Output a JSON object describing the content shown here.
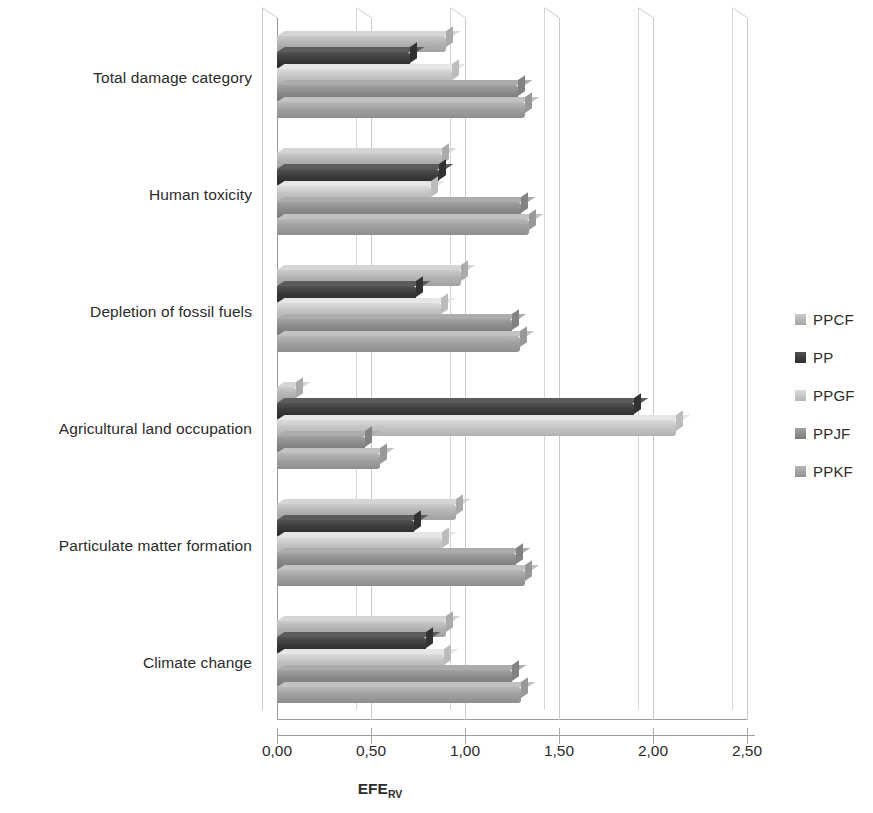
{
  "chart_data": {
    "type": "bar",
    "orientation": "horizontal",
    "title": "",
    "xlabel": "EFE RV",
    "xlabel_base": "EFE",
    "xlabel_subscript": "RV",
    "ylabel": "",
    "xlim": [
      0.0,
      2.5
    ],
    "xticks": [
      0.0,
      0.5,
      1.0,
      1.5,
      2.0,
      2.5
    ],
    "xtick_labels": [
      "0,00",
      "0,50",
      "1,00",
      "1,50",
      "2,00",
      "2,50"
    ],
    "grid": true,
    "grid_axis": "x",
    "legend_position": "right",
    "categories": [
      "Total damage category",
      "Human toxicity",
      "Depletion of fossil fuels",
      "Agricultural land occupation",
      "Particulate matter formation",
      "Climate change"
    ],
    "series": [
      {
        "name": "PPCF",
        "color": "#b3b3b3",
        "values": [
          0.9,
          0.88,
          0.98,
          0.1,
          0.95,
          0.9
        ]
      },
      {
        "name": "PP",
        "color": "#3a3a3a",
        "values": [
          0.71,
          0.86,
          0.74,
          1.9,
          0.73,
          0.79
        ]
      },
      {
        "name": "PPGF",
        "color": "#c4c4c4",
        "values": [
          0.93,
          0.82,
          0.87,
          2.12,
          0.88,
          0.89
        ]
      },
      {
        "name": "PPJF",
        "color": "#8a8a8a",
        "values": [
          1.28,
          1.3,
          1.25,
          0.47,
          1.27,
          1.25
        ]
      },
      {
        "name": "PPKF",
        "color": "#a0a0a0",
        "values": [
          1.32,
          1.34,
          1.29,
          0.55,
          1.32,
          1.3
        ]
      }
    ]
  },
  "legend": {
    "items": [
      {
        "label": "PPCF"
      },
      {
        "label": "PP"
      },
      {
        "label": "PPGF"
      },
      {
        "label": "PPJF"
      },
      {
        "label": "PPKF"
      }
    ]
  }
}
